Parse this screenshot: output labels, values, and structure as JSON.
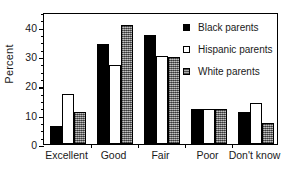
{
  "chart_data": {
    "type": "bar",
    "title": "",
    "subtitle": "",
    "xlabel": "",
    "ylabel": "Percent",
    "ylim": [
      0,
      45
    ],
    "y_ticks": [
      0,
      10,
      20,
      30,
      40
    ],
    "y_minor_tick_step": 2.5,
    "grid": false,
    "legend_position": "top-right",
    "categories": [
      "Excellent",
      "Good",
      "Fair",
      "Poor",
      "Don't know"
    ],
    "series": [
      {
        "name": "Black parents",
        "style": "solid-black",
        "color": "#000000",
        "values": [
          6,
          34,
          37,
          12,
          11
        ]
      },
      {
        "name": "Hispanic parents",
        "style": "hollow-white",
        "color": "#ffffff",
        "values": [
          17,
          27,
          30,
          12,
          14
        ]
      },
      {
        "name": "White parents",
        "style": "gray-stippled",
        "color": "#8c8c8c",
        "values": [
          11,
          40.5,
          29.5,
          12,
          7
        ]
      }
    ]
  },
  "axis": {
    "y_title": "Percent",
    "y_tick_labels": [
      "0",
      "10",
      "20",
      "30",
      "40"
    ],
    "x_tick_labels": [
      "Excellent",
      "Good",
      "Fair",
      "Poor",
      "Don't know"
    ]
  },
  "legend": {
    "items": [
      {
        "label": "Black parents",
        "swatch": "solid-black-swatch"
      },
      {
        "label": "Hispanic parents",
        "swatch": "hollow-white-swatch"
      },
      {
        "label": "White parents",
        "swatch": "gray-stippled-swatch"
      }
    ]
  }
}
